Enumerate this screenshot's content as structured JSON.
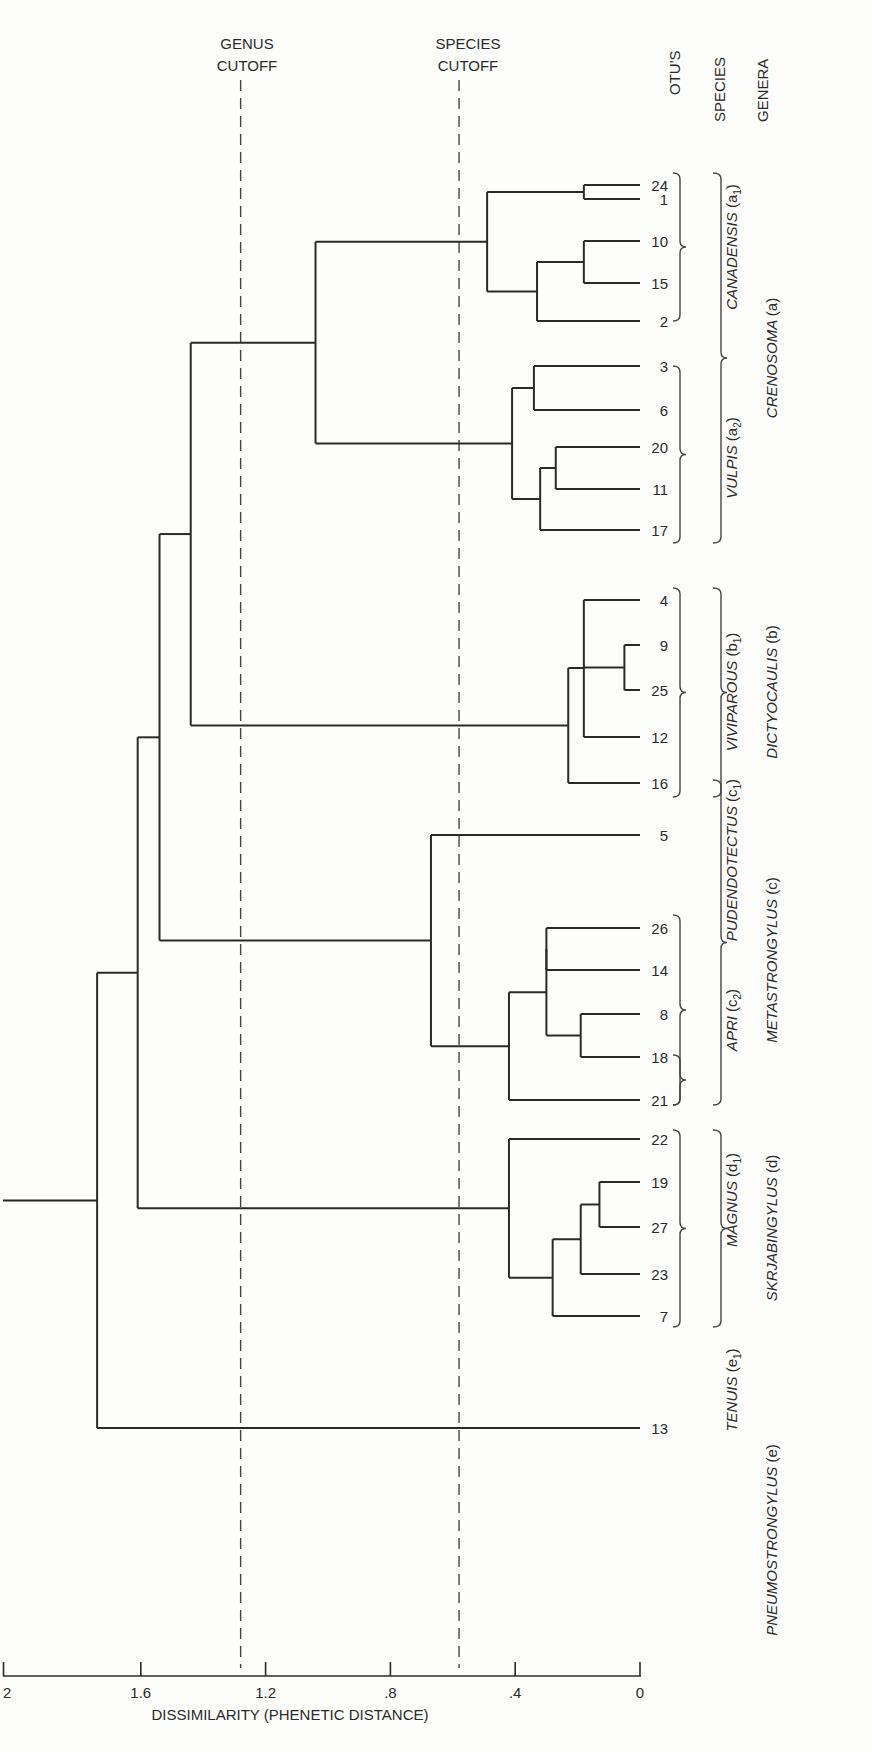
{
  "chart_data": {
    "type": "dendrogram",
    "orientation": "horizontal, leaves on right, distance increases to the left",
    "xlabel": "DISSIMILARITY (PHENETIC DISTANCE)",
    "xlim": [
      2.0,
      0
    ],
    "ticks": [
      {
        "value": 2.0,
        "label": "2"
      },
      {
        "value": 1.6,
        "label": "1.6"
      },
      {
        "value": 1.2,
        "label": "1.2"
      },
      {
        "value": 0.8,
        "label": ".8"
      },
      {
        "value": 0.4,
        "label": ".4"
      },
      {
        "value": 0.0,
        "label": "0"
      }
    ],
    "cutoffs": [
      {
        "name": "genus",
        "label_lines": [
          "GENUS",
          "CUTOFF"
        ],
        "value": 1.28
      },
      {
        "name": "species",
        "label_lines": [
          "SPECIES",
          "CUTOFF"
        ],
        "value": 0.58
      }
    ],
    "column_headers": [
      "OTU'S",
      "SPECIES",
      "GENERA"
    ],
    "leaves": [
      {
        "otu": "24",
        "y": 185
      },
      {
        "otu": "1",
        "y": 199
      },
      {
        "otu": "10",
        "y": 241
      },
      {
        "otu": "15",
        "y": 283
      },
      {
        "otu": "2",
        "y": 321
      },
      {
        "otu": "3",
        "y": 366
      },
      {
        "otu": "6",
        "y": 410
      },
      {
        "otu": "20",
        "y": 447
      },
      {
        "otu": "11",
        "y": 489
      },
      {
        "otu": "17",
        "y": 530
      },
      {
        "otu": "4",
        "y": 600
      },
      {
        "otu": "9",
        "y": 645
      },
      {
        "otu": "25",
        "y": 690
      },
      {
        "otu": "12",
        "y": 737
      },
      {
        "otu": "16",
        "y": 783
      },
      {
        "otu": "5",
        "y": 835
      },
      {
        "otu": "26",
        "y": 928
      },
      {
        "otu": "14",
        "y": 970
      },
      {
        "otu": "8",
        "y": 1014
      },
      {
        "otu": "18",
        "y": 1057
      },
      {
        "otu": "21",
        "y": 1100
      },
      {
        "otu": "22",
        "y": 1139
      },
      {
        "otu": "19",
        "y": 1182
      },
      {
        "otu": "27",
        "y": 1227
      },
      {
        "otu": "23",
        "y": 1274
      },
      {
        "otu": "7",
        "y": 1316
      },
      {
        "otu": "13",
        "y": 1428
      }
    ],
    "merges": [
      {
        "id": "n1",
        "children": [
          "24",
          "1"
        ],
        "distance": 0.18
      },
      {
        "id": "n2",
        "children": [
          "10",
          "15"
        ],
        "distance": 0.18
      },
      {
        "id": "n3",
        "children": [
          "n2",
          "2"
        ],
        "distance": 0.33
      },
      {
        "id": "n4",
        "children": [
          "n1",
          "n3"
        ],
        "distance": 0.49
      },
      {
        "id": "n5",
        "children": [
          "3",
          "6"
        ],
        "distance": 0.34
      },
      {
        "id": "n6",
        "children": [
          "20",
          "11"
        ],
        "distance": 0.27
      },
      {
        "id": "n7",
        "children": [
          "n6",
          "17"
        ],
        "distance": 0.32
      },
      {
        "id": "n8",
        "children": [
          "n5",
          "n7"
        ],
        "distance": 0.41
      },
      {
        "id": "n9",
        "children": [
          "n4",
          "n8"
        ],
        "distance": 1.04
      },
      {
        "id": "n10",
        "children": [
          "9",
          "25"
        ],
        "distance": 0.05
      },
      {
        "id": "n11",
        "children": [
          "4",
          "12"
        ],
        "distance": 0.18
      },
      {
        "id": "n12",
        "children": [
          "n11",
          "n10"
        ],
        "distance": 0.18
      },
      {
        "id": "n13",
        "children": [
          "n12",
          "16"
        ],
        "distance": 0.23
      },
      {
        "id": "n14",
        "children": [
          "n9",
          "n13"
        ],
        "distance": 1.44
      },
      {
        "id": "n15",
        "children": [
          "8",
          "18"
        ],
        "distance": 0.19
      },
      {
        "id": "n16",
        "children": [
          "26",
          "14"
        ],
        "distance": 0.3
      },
      {
        "id": "n17",
        "children": [
          "n16",
          "n15"
        ],
        "distance": 0.3
      },
      {
        "id": "n18",
        "children": [
          "n17",
          "21"
        ],
        "distance": 0.42
      },
      {
        "id": "n19",
        "children": [
          "5",
          "n18"
        ],
        "distance": 0.67
      },
      {
        "id": "n20",
        "children": [
          "n14",
          "n19"
        ],
        "distance": 1.54
      },
      {
        "id": "n21",
        "children": [
          "19",
          "27"
        ],
        "distance": 0.13
      },
      {
        "id": "n22",
        "children": [
          "n21",
          "23"
        ],
        "distance": 0.19
      },
      {
        "id": "n23",
        "children": [
          "n22",
          "7"
        ],
        "distance": 0.28
      },
      {
        "id": "n24",
        "children": [
          "22",
          "n23"
        ],
        "distance": 0.42
      },
      {
        "id": "n25",
        "children": [
          "n20",
          "n24"
        ],
        "distance": 1.61
      },
      {
        "id": "n26",
        "children": [
          "n25",
          "13"
        ],
        "distance": 1.74
      }
    ],
    "species": [
      {
        "name": "CANADENSIS",
        "code": "a",
        "sub": "1",
        "otus": [
          "24",
          "1",
          "10",
          "15",
          "2"
        ]
      },
      {
        "name": "VULPIS",
        "code": "a",
        "sub": "2",
        "otus": [
          "3",
          "6",
          "20",
          "11",
          "17"
        ]
      },
      {
        "name": "VIVIPAROUS",
        "code": "b",
        "sub": "1",
        "otus": [
          "4",
          "9",
          "25",
          "12",
          "16"
        ]
      },
      {
        "name": "PUDENDOTECTUS",
        "code": "c",
        "sub": "1",
        "otus": [
          "5"
        ]
      },
      {
        "name": "APRI",
        "code": "c",
        "sub": "2",
        "otus": [
          "26",
          "14",
          "8",
          "18",
          "21"
        ]
      },
      {
        "name": "MAGNUS",
        "code": "d",
        "sub": "1",
        "otus": [
          "22",
          "19",
          "27",
          "23",
          "7"
        ]
      },
      {
        "name": "TENUIS",
        "code": "e",
        "sub": "1",
        "otus": [
          "13"
        ]
      }
    ],
    "genera": [
      {
        "name": "CRENOSOMA",
        "code": "a"
      },
      {
        "name": "DICTYOCAULIS",
        "code": "b"
      },
      {
        "name": "METASTRONGYLUS",
        "code": "c"
      },
      {
        "name": "SKRJABINGYLUS",
        "code": "d"
      },
      {
        "name": "PNEUMOSTRONGYLUS",
        "code": "e"
      }
    ]
  },
  "labels": {
    "genus_cutoff_1": "GENUS",
    "genus_cutoff_2": "CUTOFF",
    "species_cutoff_1": "SPECIES",
    "species_cutoff_2": "CUTOFF",
    "col_otus": "OTU'S",
    "col_species": "SPECIES",
    "col_genera": "GENERA",
    "xlabel": "DISSIMILARITY (PHENETIC DISTANCE)"
  }
}
